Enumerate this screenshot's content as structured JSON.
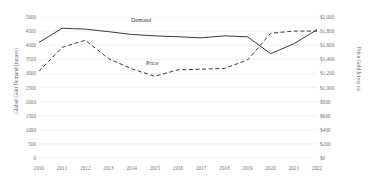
{
  "chart_data": {
    "type": "line",
    "title": "",
    "xlabel": "",
    "ylabel": "Global Gold Demand (tonnes)",
    "ylabel_right": "Price Gold $/troy oz",
    "grid": true,
    "legend_position": "inline-labels",
    "categories": [
      "2010",
      "2011",
      "2012",
      "2013",
      "2014",
      "2015",
      "2016",
      "2017",
      "2018",
      "2019",
      "2020",
      "2021",
      "2022"
    ],
    "ylim": [
      0,
      5000
    ],
    "yticks": [
      "5000",
      "4500",
      "4000",
      "3500",
      "3000",
      "2500",
      "2000",
      "1500",
      "1000",
      "500",
      "0"
    ],
    "ylim_right": [
      0,
      2000
    ],
    "yticks_right": [
      "$2,000",
      "$1,800",
      "$1,600",
      "$1,400",
      "$1,200",
      "$1,000",
      "$800",
      "$600",
      "$400",
      "$200",
      "$0"
    ],
    "series": [
      {
        "name": "Demand",
        "axis": "left",
        "style": "solid",
        "color": "#3b3b3b",
        "values": [
          4100,
          4600,
          4570,
          4480,
          4380,
          4330,
          4300,
          4260,
          4330,
          4300,
          3700,
          4050,
          4550
        ]
      },
      {
        "name": "Price",
        "axis": "right",
        "style": "dashed",
        "color": "#3b3b3b",
        "values": [
          1230,
          1570,
          1670,
          1410,
          1265,
          1160,
          1250,
          1260,
          1270,
          1390,
          1770,
          1800,
          1800
        ]
      }
    ],
    "annotations": [
      {
        "text": "Demand",
        "series": "Demand"
      },
      {
        "text": "Price",
        "series": "Price"
      }
    ]
  }
}
